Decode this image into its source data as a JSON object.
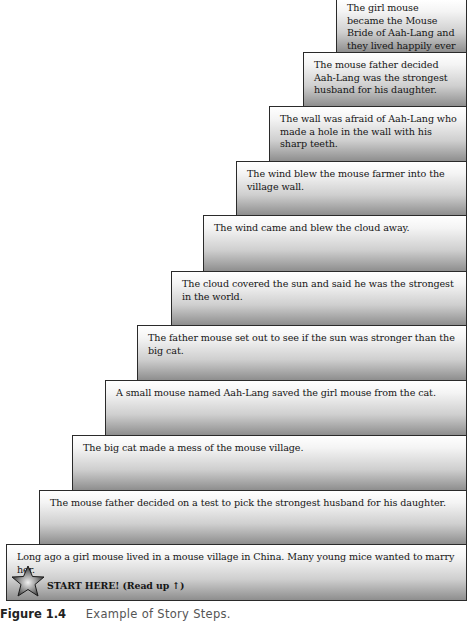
{
  "diagram": {
    "type": "story-staircase",
    "reading_direction": "bottom-to-top",
    "steps": [
      {
        "order": 1,
        "text": "Long ago a girl mouse lived in a mouse village in China. Many young mice wanted to marry her."
      },
      {
        "order": 2,
        "text": "The mouse father decided on a test to pick the strongest husband for his daughter."
      },
      {
        "order": 3,
        "text": "The big cat made a mess of the mouse village."
      },
      {
        "order": 4,
        "text": "A small mouse named Aah-Lang saved the girl mouse from the cat."
      },
      {
        "order": 5,
        "text": "The father mouse set out to see if the sun was stronger than the big cat."
      },
      {
        "order": 6,
        "text": "The cloud covered the sun and said he was the strongest in the world."
      },
      {
        "order": 7,
        "text": "The wind came and blew the cloud away."
      },
      {
        "order": 8,
        "text": "The wind blew the mouse farmer into the village wall."
      },
      {
        "order": 9,
        "text": "The wall was afraid of Aah-Lang who made a hole in the wall with his sharp teeth."
      },
      {
        "order": 10,
        "text": "The mouse father decided Aah-Lang was the strongest husband for his daughter."
      },
      {
        "order": 11,
        "text": "The girl mouse became the Mouse Bride of Aah-Lang and they lived happily ever after."
      }
    ],
    "start_marker": {
      "icon": "star-icon",
      "label": "START HERE! (Read up",
      "arrow": "↑",
      "close": ")"
    }
  },
  "caption": {
    "figure_number": "Figure 1.4",
    "title": "Example of Story Steps."
  }
}
